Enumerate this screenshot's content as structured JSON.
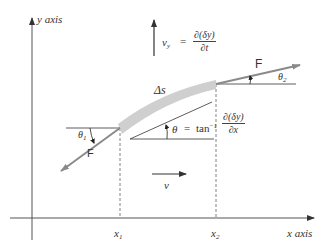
{
  "figure": {
    "axes": {
      "y_label": "y axis",
      "x_label": "x axis",
      "x_marks": [
        {
          "label": "x",
          "sub": "1"
        },
        {
          "label": "x",
          "sub": "2"
        }
      ]
    },
    "segment_label": "Δs",
    "forces": {
      "right": {
        "label": "F",
        "angle_label": "θ",
        "angle_sub": "2"
      },
      "left": {
        "label": "F",
        "angle_label": "θ",
        "angle_sub": "1"
      }
    },
    "vertical_velocity": {
      "symbol": "v",
      "sub": "y",
      "equals": "=",
      "numerator": "∂(δy)",
      "denominator": "∂t"
    },
    "slope_angle": {
      "symbol": "θ",
      "equals": "=",
      "func": "tan",
      "power": "−1",
      "numerator": "∂(δy)",
      "denominator": "∂x"
    },
    "horizontal_velocity": {
      "symbol": "v"
    },
    "colors": {
      "axis": "#555555",
      "force_arrow": "#8a8a8a",
      "segment": "#cfcfcf",
      "line": "#333333"
    }
  }
}
